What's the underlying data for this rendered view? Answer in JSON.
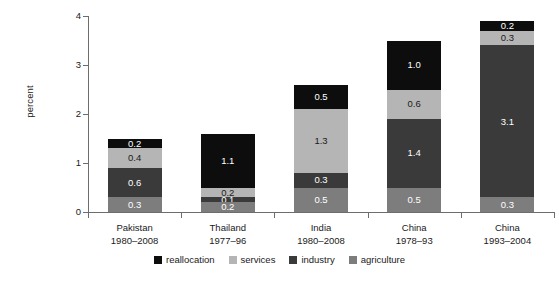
{
  "chart_data": {
    "type": "bar",
    "stacked": true,
    "title": "",
    "xlabel": "",
    "ylabel": "percent",
    "ylim": [
      0,
      4
    ],
    "yticks": [
      0,
      1,
      2,
      3,
      4
    ],
    "ytick_labels": [
      "0",
      "1",
      "2",
      "3",
      "4"
    ],
    "grid": false,
    "legend_position": "bottom",
    "categories": [
      {
        "name": "Pakistan",
        "period": "1980–2008"
      },
      {
        "name": "Thailand",
        "period": "1977–96"
      },
      {
        "name": "India",
        "period": "1980–2008"
      },
      {
        "name": "China",
        "period": "1978–93"
      },
      {
        "name": "China",
        "period": "1993–2004"
      }
    ],
    "series": [
      {
        "name": "agriculture",
        "color": "#7d7d7d",
        "label_color": "#ffffff",
        "values": [
          0.3,
          0.2,
          0.5,
          0.5,
          0.3
        ],
        "labels": [
          "0.3",
          "0.2",
          "0.5",
          "0.5",
          "0.3"
        ]
      },
      {
        "name": "industry",
        "color": "#3a3a3a",
        "label_color": "#ffffff",
        "values": [
          0.6,
          0.1,
          0.3,
          1.4,
          3.1
        ],
        "labels": [
          "0.6",
          "0.1",
          "0.3",
          "1.4",
          "3.1"
        ]
      },
      {
        "name": "services",
        "color": "#b5b5b5",
        "label_color": "#1a1a1a",
        "values": [
          0.4,
          0.2,
          1.3,
          0.6,
          0.3
        ],
        "labels": [
          "0.4",
          "0.2",
          "1.3",
          "0.6",
          "0.3"
        ]
      },
      {
        "name": "reallocation",
        "color": "#0d0d0d",
        "label_color": "#ffffff",
        "values": [
          0.2,
          1.1,
          0.5,
          1.0,
          0.2
        ],
        "labels": [
          "0.2",
          "1.1",
          "0.5",
          "1.0",
          "0.2"
        ]
      }
    ],
    "totals": [
      1.5,
      1.6,
      2.6,
      3.5,
      3.9
    ]
  },
  "legend": {
    "items": [
      {
        "label": "reallocation",
        "color": "#0d0d0d"
      },
      {
        "label": "services",
        "color": "#b5b5b5"
      },
      {
        "label": "industry",
        "color": "#3a3a3a"
      },
      {
        "label": "agriculture",
        "color": "#7d7d7d"
      }
    ]
  },
  "axis": {
    "y_label": "percent"
  }
}
